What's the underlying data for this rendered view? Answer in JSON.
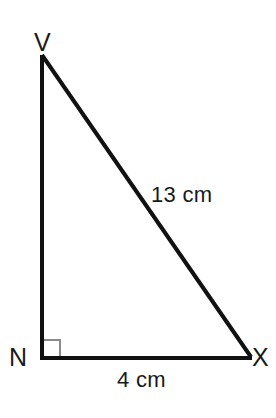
{
  "figure": {
    "kind": "right-triangle-diagram",
    "width": 276,
    "height": 418,
    "background_color": "#ffffff",
    "stroke_color": "#111111",
    "stroke_width": 4,
    "right_angle_marker": {
      "at_vertex": "N",
      "color": "#8c8c8c",
      "size": 18,
      "stroke_width": 2
    },
    "vertices": [
      {
        "name": "V",
        "label": "V",
        "x": 42,
        "y": 55
      },
      {
        "name": "N",
        "label": "N",
        "x": 42,
        "y": 358
      },
      {
        "name": "X",
        "label": "X",
        "x": 250,
        "y": 358
      }
    ],
    "sides": [
      {
        "name": "VN",
        "from": "V",
        "to": "N",
        "label": "",
        "labeled": false
      },
      {
        "name": "VX",
        "from": "V",
        "to": "X",
        "label": "13 cm",
        "labeled": true
      },
      {
        "name": "NX",
        "from": "N",
        "to": "X",
        "label": "4 cm",
        "labeled": true
      }
    ],
    "labels": {
      "vertex_v": "V",
      "vertex_n": "N",
      "vertex_x": "X",
      "hypotenuse": "13 cm",
      "base": "4 cm"
    }
  }
}
